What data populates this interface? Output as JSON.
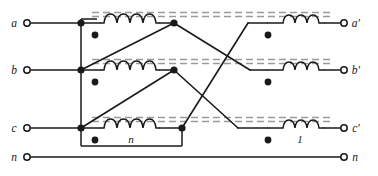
{
  "figure": {
    "kind": "three-phase-transformer-connection-diagram",
    "width": 378,
    "height": 176,
    "background_color": "#ffffff",
    "line_color": "#1a1a1a",
    "core_color": "#9a9a9a"
  },
  "terminals": {
    "left": [
      {
        "id": "a",
        "label": "a",
        "x": 24,
        "y": 23
      },
      {
        "id": "b",
        "label": "b",
        "x": 24,
        "y": 70
      },
      {
        "id": "c",
        "label": "c",
        "x": 24,
        "y": 128
      },
      {
        "id": "n",
        "label": "n",
        "x": 24,
        "y": 157
      }
    ],
    "right": [
      {
        "id": "ap",
        "label": "a′",
        "x": 348,
        "y": 23
      },
      {
        "id": "bp",
        "label": "b′",
        "x": 348,
        "y": 70
      },
      {
        "id": "cp",
        "label": "c′",
        "x": 348,
        "y": 128
      },
      {
        "id": "np",
        "label": "n",
        "x": 348,
        "y": 157
      }
    ]
  },
  "windings": {
    "primary": [
      {
        "id": "p1",
        "turns_label": "",
        "loops": 6,
        "x": 100,
        "y": 23,
        "width": 56
      },
      {
        "id": "p2",
        "turns_label": "",
        "loops": 6,
        "x": 100,
        "y": 70,
        "width": 56
      },
      {
        "id": "p3",
        "turns_label": "n",
        "loops": 6,
        "x": 100,
        "y": 128,
        "width": 56
      }
    ],
    "secondary": [
      {
        "id": "s1",
        "turns_label": "",
        "loops": 3,
        "x": 282,
        "y": 23,
        "width": 30
      },
      {
        "id": "s2",
        "turns_label": "",
        "loops": 3,
        "x": 282,
        "y": 70,
        "width": 30
      },
      {
        "id": "s3",
        "turns_label": "1",
        "loops": 3,
        "x": 282,
        "y": 128,
        "width": 30
      }
    ]
  },
  "labels": {
    "primary_turns": "n",
    "secondary_turns": "1"
  },
  "cores": [
    {
      "id": "core-top",
      "y": 15,
      "x1": 92,
      "x2": 330
    },
    {
      "id": "core-middle",
      "y": 62,
      "x1": 92,
      "x2": 330
    },
    {
      "id": "core-bottom",
      "y": 120,
      "x1": 92,
      "x2": 330
    }
  ],
  "nodes": [
    {
      "id": "bus-a",
      "x": 81,
      "y": 23
    },
    {
      "id": "bus-b",
      "x": 81,
      "y": 70
    },
    {
      "id": "bus-c",
      "x": 81,
      "y": 128
    },
    {
      "id": "pri-out-a",
      "x": 174,
      "y": 23
    },
    {
      "id": "pri-out-b",
      "x": 174,
      "y": 70
    },
    {
      "id": "pri-out-c",
      "x": 174,
      "y": 128
    }
  ],
  "polarity_dots": [
    {
      "id": "dot-p1",
      "x": 95,
      "y": 35
    },
    {
      "id": "dot-p2",
      "x": 95,
      "y": 82
    },
    {
      "id": "dot-p3",
      "x": 95,
      "y": 140
    },
    {
      "id": "dot-s1",
      "x": 268,
      "y": 35
    },
    {
      "id": "dot-s2",
      "x": 268,
      "y": 82
    },
    {
      "id": "dot-s3",
      "x": 268,
      "y": 140
    }
  ],
  "connection_box": {
    "id": "primary-delta-box",
    "x": 78,
    "y": 18,
    "width": 104,
    "height": 128
  }
}
